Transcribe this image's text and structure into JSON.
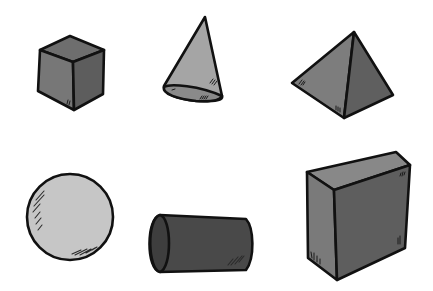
{
  "illustration": {
    "title": "3D geometric shapes",
    "background": "#ffffff",
    "outline_color": "#111111",
    "shapes": [
      {
        "name": "cube",
        "row": 1,
        "col": 1,
        "colors": {
          "top": "#6e6e6e",
          "left": "#777777",
          "right": "#5d5d5d"
        }
      },
      {
        "name": "cone",
        "row": 1,
        "col": 2,
        "colors": {
          "side": "#a5a5a5",
          "base": "#8a8a8a"
        }
      },
      {
        "name": "pyramid",
        "row": 1,
        "col": 3,
        "colors": {
          "left": "#7d7d7d",
          "right": "#5f5f5f"
        }
      },
      {
        "name": "sphere",
        "row": 2,
        "col": 1,
        "colors": {
          "body": "#c6c6c6"
        }
      },
      {
        "name": "cylinder",
        "row": 2,
        "col": 2,
        "colors": {
          "end": "#3e3e3e",
          "body": "#494949"
        }
      },
      {
        "name": "rectangular-prism",
        "row": 2,
        "col": 3,
        "colors": {
          "top": "#888888",
          "left": "#7a7a7a",
          "front": "#5e5e5e"
        }
      }
    ]
  }
}
